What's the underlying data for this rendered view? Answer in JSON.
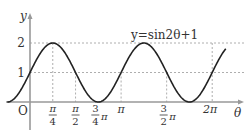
{
  "chart_data": {
    "type": "line",
    "title": "",
    "equation_label": "y=sin2θ+1",
    "xlabel": "θ",
    "ylabel": "y",
    "origin_label": "O",
    "x_ticks": [
      {
        "value": 0.7854,
        "label_num": "π",
        "label_den": "4"
      },
      {
        "value": 1.5708,
        "label_num": "π",
        "label_den": "2"
      },
      {
        "value": 2.3562,
        "label_num": "3",
        "label_den": "4",
        "label_suffix": "π"
      },
      {
        "value": 3.1416,
        "label": "π"
      },
      {
        "value": 4.7124,
        "label_num": "3",
        "label_den": "2",
        "label_suffix": "π"
      },
      {
        "value": 6.2832,
        "label": "2π"
      }
    ],
    "y_ticks": [
      {
        "value": 1,
        "label": "1"
      },
      {
        "value": 2,
        "label": "2"
      }
    ],
    "series": [
      {
        "name": "y=sin2θ+1",
        "function": "sin(2*theta)+1",
        "x_range": [
          -0.785,
          6.75
        ]
      }
    ],
    "xlim": [
      -0.8,
      7.1
    ],
    "ylim": [
      0,
      2.5
    ],
    "grid": "dashed guide lines at y=1, y=2 and at tick positions",
    "legend": "none"
  }
}
